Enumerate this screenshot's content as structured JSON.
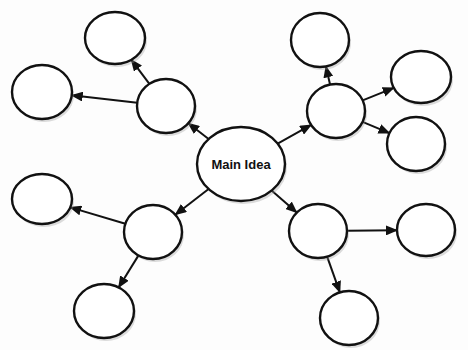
{
  "diagram": {
    "type": "mind-map",
    "colors": {
      "stroke": "#111111",
      "fill": "#ffffff",
      "background": "#fdfdfd"
    },
    "main": {
      "id": "main",
      "label": "Main Idea",
      "cx": 241,
      "cy": 164,
      "rx": 44,
      "ry": 37
    },
    "nodes": [
      {
        "id": "tl",
        "label": "",
        "cx": 166,
        "cy": 106,
        "rx": 29,
        "ry": 27
      },
      {
        "id": "tl-top",
        "label": "",
        "cx": 115,
        "cy": 38,
        "rx": 30,
        "ry": 26
      },
      {
        "id": "tl-left",
        "label": "",
        "cx": 42,
        "cy": 92,
        "rx": 30,
        "ry": 27
      },
      {
        "id": "tr",
        "label": "",
        "cx": 336,
        "cy": 111,
        "rx": 29,
        "ry": 27
      },
      {
        "id": "tr-top",
        "label": "",
        "cx": 320,
        "cy": 40,
        "rx": 29,
        "ry": 27
      },
      {
        "id": "tr-right",
        "label": "",
        "cx": 421,
        "cy": 77,
        "rx": 30,
        "ry": 26
      },
      {
        "id": "tr-lower",
        "label": "",
        "cx": 416,
        "cy": 144,
        "rx": 29,
        "ry": 27
      },
      {
        "id": "bl",
        "label": "",
        "cx": 153,
        "cy": 232,
        "rx": 29,
        "ry": 27
      },
      {
        "id": "bl-left",
        "label": "",
        "cx": 42,
        "cy": 199,
        "rx": 30,
        "ry": 25
      },
      {
        "id": "bl-bottom",
        "label": "",
        "cx": 104,
        "cy": 311,
        "rx": 30,
        "ry": 27
      },
      {
        "id": "br",
        "label": "",
        "cx": 318,
        "cy": 231,
        "rx": 29,
        "ry": 27
      },
      {
        "id": "br-right",
        "label": "",
        "cx": 426,
        "cy": 230,
        "rx": 29,
        "ry": 26
      },
      {
        "id": "br-bottom",
        "label": "",
        "cx": 349,
        "cy": 318,
        "rx": 29,
        "ry": 27
      }
    ],
    "edges": [
      {
        "from": "main",
        "to": "tl"
      },
      {
        "from": "tl",
        "to": "tl-top"
      },
      {
        "from": "tl",
        "to": "tl-left"
      },
      {
        "from": "main",
        "to": "tr"
      },
      {
        "from": "tr",
        "to": "tr-top"
      },
      {
        "from": "tr",
        "to": "tr-right"
      },
      {
        "from": "tr",
        "to": "tr-lower"
      },
      {
        "from": "main",
        "to": "bl"
      },
      {
        "from": "bl",
        "to": "bl-left"
      },
      {
        "from": "bl",
        "to": "bl-bottom"
      },
      {
        "from": "main",
        "to": "br"
      },
      {
        "from": "br",
        "to": "br-right"
      },
      {
        "from": "br",
        "to": "br-bottom"
      }
    ]
  }
}
